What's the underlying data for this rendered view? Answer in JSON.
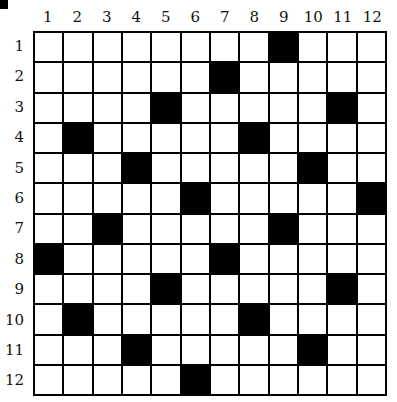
{
  "puzzle": {
    "rows": 12,
    "cols": 12,
    "column_labels": [
      "1",
      "2",
      "3",
      "4",
      "5",
      "6",
      "7",
      "8",
      "9",
      "10",
      "11",
      "12"
    ],
    "row_labels": [
      "1",
      "2",
      "3",
      "4",
      "5",
      "6",
      "7",
      "8",
      "9",
      "10",
      "11",
      "12"
    ],
    "black_cells": [
      [
        1,
        9
      ],
      [
        2,
        7
      ],
      [
        3,
        5
      ],
      [
        3,
        11
      ],
      [
        4,
        2
      ],
      [
        4,
        8
      ],
      [
        5,
        4
      ],
      [
        5,
        10
      ],
      [
        6,
        6
      ],
      [
        6,
        12
      ],
      [
        7,
        3
      ],
      [
        7,
        9
      ],
      [
        8,
        1
      ],
      [
        8,
        7
      ],
      [
        9,
        5
      ],
      [
        9,
        11
      ],
      [
        10,
        2
      ],
      [
        10,
        8
      ],
      [
        11,
        4
      ],
      [
        11,
        10
      ],
      [
        12,
        6
      ]
    ],
    "colors": {
      "black": "#000000",
      "white": "#ffffff",
      "grid_line": "#000000"
    }
  }
}
